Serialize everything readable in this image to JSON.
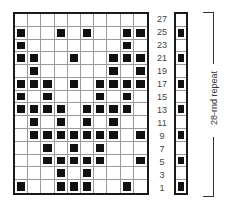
{
  "chart": {
    "columns": 10,
    "rows_displayed": [
      27,
      25,
      23,
      21,
      19,
      17,
      15,
      13,
      11,
      9,
      7,
      5,
      3,
      1
    ],
    "main_grid": [
      {
        "row": 27,
        "filled": []
      },
      {
        "row": 25,
        "filled": [
          1,
          4,
          6,
          9,
          10
        ]
      },
      {
        "row": 23,
        "filled": [
          1,
          9
        ]
      },
      {
        "row": 21,
        "filled": [
          1,
          2,
          5,
          8,
          9,
          10
        ]
      },
      {
        "row": 19,
        "filled": [
          2,
          8,
          10
        ]
      },
      {
        "row": 17,
        "filled": [
          1,
          2,
          3,
          5,
          7,
          8,
          9,
          10
        ]
      },
      {
        "row": 15,
        "filled": [
          1,
          3,
          7,
          9
        ]
      },
      {
        "row": 13,
        "filled": [
          1,
          2,
          3,
          4,
          6,
          7,
          8,
          9
        ]
      },
      {
        "row": 11,
        "filled": [
          2,
          4,
          6,
          8
        ]
      },
      {
        "row": 9,
        "filled": [
          2,
          3,
          4,
          5,
          6,
          7,
          8,
          10
        ]
      },
      {
        "row": 7,
        "filled": [
          3,
          5,
          7
        ]
      },
      {
        "row": 5,
        "filled": [
          3,
          4,
          5,
          6,
          7,
          10
        ]
      },
      {
        "row": 3,
        "filled": [
          4,
          6
        ]
      },
      {
        "row": 1,
        "filled": [
          1,
          4,
          5,
          6,
          9
        ]
      }
    ],
    "strip": [
      {
        "row": 27,
        "filled": false
      },
      {
        "row": 25,
        "filled": true
      },
      {
        "row": 23,
        "filled": false
      },
      {
        "row": 21,
        "filled": true
      },
      {
        "row": 19,
        "filled": false
      },
      {
        "row": 17,
        "filled": true
      },
      {
        "row": 15,
        "filled": false
      },
      {
        "row": 13,
        "filled": true
      },
      {
        "row": 11,
        "filled": false
      },
      {
        "row": 9,
        "filled": true
      },
      {
        "row": 7,
        "filled": false
      },
      {
        "row": 5,
        "filled": true
      },
      {
        "row": 3,
        "filled": false
      },
      {
        "row": 1,
        "filled": true
      }
    ],
    "row_labels": [
      "27",
      "25",
      "23",
      "21",
      "19",
      "17",
      "15",
      "13",
      "11",
      "9",
      "7",
      "5",
      "3",
      "1"
    ],
    "bracket_label": "28-rnd repeat",
    "colors": {
      "filled": "#111111",
      "empty": "#ffffff",
      "grid_line": "#9a9a9a",
      "border": "#1a1a1a"
    }
  }
}
